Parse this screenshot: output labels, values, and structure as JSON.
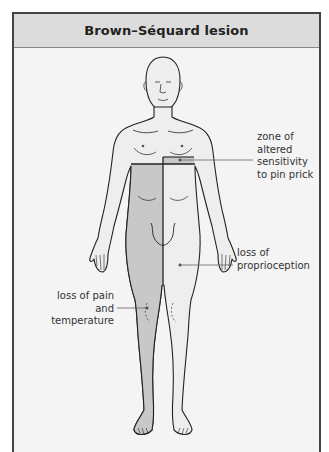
{
  "title": "Brown–Séquard lesion",
  "colors": {
    "frame_border": "#444444",
    "title_bg": "#dcdcdc",
    "panel_bg": "#f4f4f4",
    "body_fill": "#eeeeee",
    "affected_fill": "#c8c8c8",
    "outline": "#222222"
  },
  "labels": {
    "zone": [
      "zone of",
      "altered",
      "sensitivity",
      "to pin prick"
    ],
    "proprioception": [
      "loss of",
      "proprioception"
    ],
    "pain": [
      "loss of pain",
      "and",
      "temperature"
    ]
  }
}
